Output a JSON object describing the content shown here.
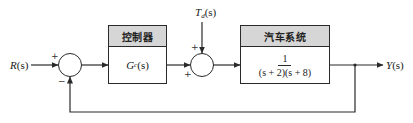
{
  "diagram": {
    "type": "feedback control block diagram",
    "input": {
      "label": "R(s)",
      "var": "R",
      "arg": "(s)"
    },
    "output": {
      "label": "Y(s)",
      "var": "Y",
      "arg": "(s)"
    },
    "disturbance": {
      "label": "T_d(s)",
      "var": "T",
      "sub": "d",
      "arg": "(s)"
    },
    "summing_junction_1": {
      "signs": {
        "reference": "+",
        "feedback": "−"
      }
    },
    "summing_junction_2": {
      "signs": {
        "disturbance": "+",
        "controller": "+"
      }
    },
    "controller_block": {
      "title": "控制器",
      "transfer_function": {
        "var": "G",
        "sub": "c",
        "arg": "(s)"
      }
    },
    "plant_block": {
      "title": "汽车系统",
      "transfer_function": {
        "numerator": "1",
        "denominator": "(s + 2)(s + 8)"
      }
    },
    "feedback": {
      "type": "unity",
      "sign": "negative"
    },
    "colors": {
      "line": "#2a2a2a",
      "header_fill": "#d6d6d6",
      "background": "#ffffff"
    }
  }
}
